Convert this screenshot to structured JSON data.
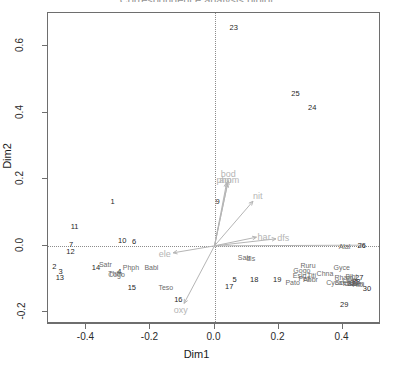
{
  "chart_data": {
    "type": "scatter",
    "title": "Correspondence analysis biplot",
    "xlabel": "Dim1",
    "ylabel": "Dim2",
    "xlim": [
      -0.52,
      0.52
    ],
    "ylim": [
      -0.235,
      0.7
    ],
    "grid": false,
    "legend": "none",
    "xticks": [
      -0.4,
      -0.2,
      0.0,
      0.2,
      0.4
    ],
    "xtick_labels": [
      "-0.4",
      "-0.2",
      "0.0",
      "0.2",
      "0.4"
    ],
    "yticks": [
      -0.2,
      0.0,
      0.2,
      0.4,
      0.6
    ],
    "ytick_labels": [
      "-0.2",
      "0.0",
      "0.2",
      "0.4",
      "0.6"
    ],
    "reference_lines": {
      "vertical_x": 0.0,
      "horizontal_y": 0.0,
      "style": "dotted"
    },
    "series": [
      {
        "name": "sites",
        "color": "#1f1f1f",
        "points": [
          {
            "label": "1",
            "x": -0.318,
            "y": 0.133
          },
          {
            "label": "2",
            "x": -0.5,
            "y": -0.063
          },
          {
            "label": "3",
            "x": -0.481,
            "y": -0.08
          },
          {
            "label": "4",
            "x": -0.297,
            "y": -0.078
          },
          {
            "label": "5",
            "x": 0.063,
            "y": -0.103
          },
          {
            "label": "6",
            "x": -0.251,
            "y": 0.013
          },
          {
            "label": "7",
            "x": -0.448,
            "y": 0.003
          },
          {
            "label": "9",
            "x": 0.01,
            "y": 0.133
          },
          {
            "label": "10",
            "x": -0.288,
            "y": 0.016
          },
          {
            "label": "11",
            "x": -0.437,
            "y": 0.057
          },
          {
            "label": "12",
            "x": -0.45,
            "y": -0.018
          },
          {
            "label": "13",
            "x": -0.483,
            "y": -0.096
          },
          {
            "label": "14",
            "x": -0.37,
            "y": -0.066
          },
          {
            "label": "15",
            "x": -0.258,
            "y": -0.126
          },
          {
            "label": "16",
            "x": -0.113,
            "y": -0.163
          },
          {
            "label": "17",
            "x": 0.046,
            "y": -0.125
          },
          {
            "label": "18",
            "x": 0.124,
            "y": -0.103
          },
          {
            "label": "19",
            "x": 0.196,
            "y": -0.102
          },
          {
            "label": "23",
            "x": 0.06,
            "y": 0.655
          },
          {
            "label": "24",
            "x": 0.305,
            "y": 0.414
          },
          {
            "label": "25",
            "x": 0.253,
            "y": 0.455
          },
          {
            "label": "26",
            "x": 0.46,
            "y": 0.001
          },
          {
            "label": "27",
            "x": 0.452,
            "y": -0.097
          },
          {
            "label": "28",
            "x": 0.443,
            "y": -0.108
          },
          {
            "label": "29",
            "x": 0.405,
            "y": -0.178
          },
          {
            "label": "30",
            "x": 0.476,
            "y": -0.13
          },
          {
            "label": "31",
            "x": 0.437,
            "y": -0.112
          },
          {
            "label": "32",
            "x": 0.428,
            "y": -0.114
          }
        ]
      },
      {
        "name": "species",
        "color": "#6b6b6b",
        "points": [
          {
            "label": "Satr",
            "x": -0.341,
            "y": -0.056
          },
          {
            "label": "Phph",
            "x": -0.261,
            "y": -0.063
          },
          {
            "label": "Babl",
            "x": -0.197,
            "y": -0.064
          },
          {
            "label": "Thth",
            "x": -0.31,
            "y": -0.083
          },
          {
            "label": "Teso",
            "x": -0.152,
            "y": -0.123
          },
          {
            "label": "Cogo",
            "x": -0.306,
            "y": -0.086
          },
          {
            "label": "Satr",
            "x": 0.093,
            "y": -0.035
          },
          {
            "label": "Alal",
            "x": 0.406,
            "y": -0.001
          },
          {
            "label": "Ruru",
            "x": 0.292,
            "y": -0.057
          },
          {
            "label": "Gogo",
            "x": 0.273,
            "y": -0.073
          },
          {
            "label": "Eslu",
            "x": 0.266,
            "y": -0.087
          },
          {
            "label": "Titi",
            "x": 0.303,
            "y": -0.087
          },
          {
            "label": "Pefl",
            "x": 0.281,
            "y": -0.098
          },
          {
            "label": "Pato",
            "x": 0.244,
            "y": -0.108
          },
          {
            "label": "Abbr",
            "x": 0.3,
            "y": -0.1
          },
          {
            "label": "Chna",
            "x": 0.345,
            "y": -0.083
          },
          {
            "label": "Gyce",
            "x": 0.397,
            "y": -0.064
          },
          {
            "label": "Blbj",
            "x": 0.427,
            "y": -0.09
          },
          {
            "label": "Rham",
            "x": 0.404,
            "y": -0.095
          },
          {
            "label": "Legi",
            "x": 0.42,
            "y": -0.103
          },
          {
            "label": "Cyca",
            "x": 0.374,
            "y": -0.109
          },
          {
            "label": "Scer",
            "x": 0.398,
            "y": -0.108
          },
          {
            "label": "Icme",
            "x": 0.424,
            "y": -0.111
          },
          {
            "label": "Anan",
            "x": 0.44,
            "y": -0.112
          },
          {
            "label": "Albi",
            "x": 0.45,
            "y": -0.115
          },
          {
            "label": "dis",
            "x": 0.113,
            "y": -0.036
          }
        ]
      }
    ],
    "variable_arrows": [
      {
        "label": "bod",
        "x": 0.043,
        "y": 0.215,
        "tip_x": 0.043,
        "tip_y": 0.196
      },
      {
        "label": "pho",
        "x": 0.03,
        "y": 0.198,
        "tip_x": 0.038,
        "tip_y": 0.19
      },
      {
        "label": "amm",
        "x": 0.046,
        "y": 0.197,
        "tip_x": 0.041,
        "tip_y": 0.188
      },
      {
        "label": "nit",
        "x": 0.135,
        "y": 0.15,
        "tip_x": 0.12,
        "tip_y": 0.134
      },
      {
        "label": "har",
        "x": 0.155,
        "y": 0.027,
        "tip_x": 0.131,
        "tip_y": 0.026
      },
      {
        "label": "dfs",
        "x": 0.215,
        "y": 0.025,
        "tip_x": 0.192,
        "tip_y": 0.021
      },
      {
        "label": "ele",
        "x": -0.155,
        "y": -0.025,
        "tip_x": -0.129,
        "tip_y": -0.021
      },
      {
        "label": "oxy",
        "x": -0.105,
        "y": -0.193,
        "tip_x": -0.095,
        "tip_y": -0.173
      },
      {
        "label": "Alal-tip",
        "x": 0.405,
        "y": 0.002,
        "tip_x": 0.47,
        "tip_y": 0.002
      }
    ],
    "arrow_origin": {
      "x": 0.0,
      "y": 0.0
    },
    "arrow_color": "#b5b5b5"
  }
}
